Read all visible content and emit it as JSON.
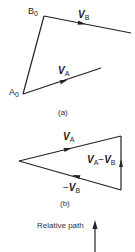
{
  "figure_a": {
    "caption": "(a)",
    "point_b0": {
      "letter": "B",
      "sub": "0"
    },
    "point_a0": {
      "letter": "A",
      "sub": "0"
    },
    "vector_b": {
      "letter": "V",
      "sub": "B"
    },
    "vector_a": {
      "letter": "V",
      "sub": "A"
    }
  },
  "figure_b": {
    "caption": "(b)",
    "vector_a": {
      "letter": "V",
      "sub": "A"
    },
    "vector_neg_b": {
      "prefix": "−",
      "letter": "V",
      "sub": "B"
    },
    "vector_diff": {
      "letter1": "V",
      "sub1": "A",
      "op": "−",
      "letter2": "V",
      "sub2": "B"
    }
  },
  "figure_c": {
    "label": "Relative path"
  },
  "colors": {
    "line": "#222222",
    "background": "#ffffff"
  }
}
